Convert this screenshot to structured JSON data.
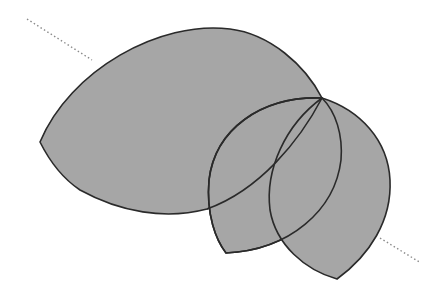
{
  "diagram": {
    "colors": {
      "fill": "#a6a6a6",
      "stroke": "#2a2a2a",
      "dotted_line": "#8a8a8a",
      "background": "#ffffff"
    },
    "shared_vertex": [
      322,
      98
    ],
    "shapes": [
      {
        "name": "large-region",
        "left_vertex": [
          40,
          142
        ]
      },
      {
        "name": "lens-1",
        "bottom_vertex": [
          226,
          253
        ]
      },
      {
        "name": "lens-2",
        "bottom_vertex": [
          337,
          279
        ]
      }
    ],
    "dotted_line": {
      "start": [
        27,
        19
      ],
      "end": [
        421,
        263
      ]
    }
  }
}
